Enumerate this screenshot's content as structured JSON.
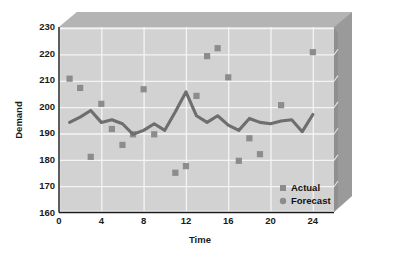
{
  "chart_data": {
    "type": "scatter",
    "title": "",
    "subtitle": "",
    "xlabel": "Time",
    "ylabel": "Demand",
    "xlim": [
      0,
      26
    ],
    "ylim": [
      160,
      230
    ],
    "xticks": [
      0,
      4,
      8,
      12,
      16,
      20,
      24
    ],
    "yticks": [
      160,
      170,
      180,
      190,
      200,
      210,
      220,
      230
    ],
    "xtick_labels": [
      "0",
      "4",
      "8",
      "12",
      "16",
      "20",
      "24"
    ],
    "ytick_labels": [
      "160",
      "170",
      "180",
      "190",
      "200",
      "210",
      "220",
      "230"
    ],
    "grid": true,
    "grid_color": "#f2f2f2",
    "legend_position": "bottom-right",
    "plot_background": "#d2d2d2",
    "series": [
      {
        "name": "Actual",
        "marker": "square",
        "color": "#8c8c8c",
        "x": [
          1,
          2,
          3,
          4,
          5,
          6,
          7,
          8,
          9,
          10,
          11,
          12,
          13,
          14,
          15,
          16,
          17,
          18,
          19,
          20,
          21,
          22,
          23,
          24
        ],
        "values": [
          210.5,
          207.0,
          181.0,
          201.0,
          191.5,
          185.5,
          189.5,
          206.5,
          189.5,
          null,
          175.0,
          177.5,
          204.0,
          219.0,
          222.0,
          211.0,
          179.5,
          188.0,
          182.0,
          null,
          200.5,
          null,
          null,
          220.5
        ]
      },
      {
        "name": "Forecast",
        "marker": "circle-line",
        "color": "#6e6e6e",
        "x": [
          1,
          2,
          3,
          4,
          5,
          6,
          7,
          8,
          9,
          10,
          11,
          12,
          13,
          14,
          15,
          16,
          17,
          18,
          19,
          20,
          21,
          22,
          23,
          24
        ],
        "values": [
          194.0,
          196.0,
          198.5,
          194.0,
          195.0,
          193.5,
          189.5,
          191.0,
          193.5,
          191.0,
          198.0,
          205.5,
          196.5,
          194.0,
          196.5,
          193.0,
          191.0,
          195.5,
          194.0,
          193.5,
          194.5,
          195.0,
          190.5,
          197.0
        ]
      }
    ]
  },
  "legend": {
    "items": [
      {
        "label": "Actual",
        "marker": "square",
        "color": "#8c8c8c"
      },
      {
        "label": "Forecast",
        "marker": "circle",
        "color": "#8c8c8c"
      }
    ]
  },
  "axes": {
    "y_title": "Demand",
    "x_title": "Time"
  }
}
